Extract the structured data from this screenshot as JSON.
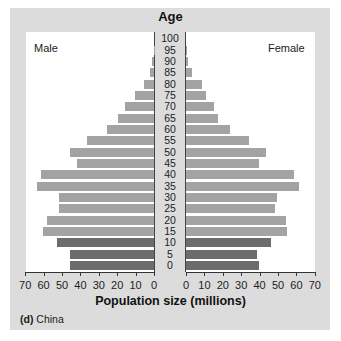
{
  "chart_data": {
    "type": "bar",
    "subtype": "population-pyramid",
    "title": "Age",
    "xlabel": "Population size (millions)",
    "caption_label": "(d)",
    "caption_text": "China",
    "left_label": "Male",
    "right_label": "Female",
    "age_labels": [
      "100",
      "95",
      "90",
      "85",
      "80",
      "75",
      "70",
      "65",
      "60",
      "55",
      "50",
      "45",
      "40",
      "35",
      "30",
      "25",
      "20",
      "15",
      "10",
      "5",
      "0"
    ],
    "categories": [
      "0",
      "5",
      "10",
      "15",
      "20",
      "25",
      "30",
      "35",
      "40",
      "45",
      "50",
      "55",
      "60",
      "65",
      "70",
      "75",
      "80",
      "85",
      "90",
      "95",
      "100"
    ],
    "series": [
      {
        "name": "Male",
        "values": [
          45.5,
          45.5,
          52.5,
          60.5,
          58,
          51.5,
          51.5,
          63.5,
          61.5,
          42,
          45.5,
          36.5,
          25.5,
          19.5,
          16,
          10.5,
          5.5,
          2,
          1,
          0.2,
          0
        ]
      },
      {
        "name": "Female",
        "values": [
          39.5,
          38.5,
          46,
          55,
          54.5,
          48.5,
          49.5,
          61.5,
          58.5,
          39.5,
          43.5,
          34,
          24,
          17.5,
          15,
          11,
          8.5,
          3.5,
          1,
          0.3,
          0
        ]
      }
    ],
    "dark_categories": [
      "0",
      "5",
      "10"
    ],
    "xlim": [
      0,
      70
    ],
    "x_ticks": [
      "70",
      "60",
      "50",
      "40",
      "30",
      "20",
      "10",
      "0"
    ],
    "x_ticks_right": [
      "0",
      "10",
      "20",
      "30",
      "40",
      "50",
      "60",
      "70"
    ],
    "grid": false,
    "colors": {
      "light_bar": "#a3a3a3",
      "dark_bar": "#6c6c6c",
      "panel": "#dcdcdc",
      "plot_bg": "#ffffff"
    }
  }
}
